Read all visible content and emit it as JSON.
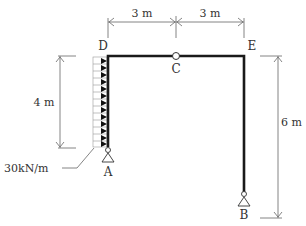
{
  "diagram": {
    "type": "structural-frame",
    "nodes": {
      "A": "A",
      "B": "B",
      "C": "C",
      "D": "D",
      "E": "E"
    },
    "dimensions": {
      "top_left": "3 m",
      "top_right": "3 m",
      "left_height": "4 m",
      "right_height": "6 m"
    },
    "load": {
      "label": "30kN/m",
      "type": "uniformly distributed, horizontal"
    },
    "colors": {
      "member": "#1a1a1a",
      "dimension": "#555555",
      "text": "#333333"
    }
  }
}
